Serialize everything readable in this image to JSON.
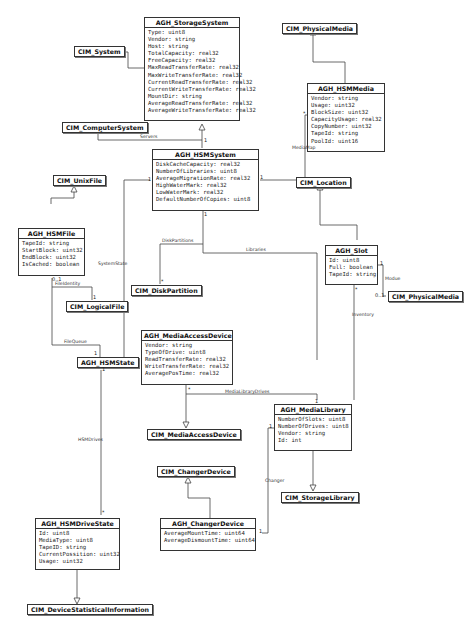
{
  "classes": {
    "storage_system": {
      "name": "AGH_StorageSystem",
      "attrs": [
        "Type: uint8",
        "Vendor: string",
        "Host: string",
        "TotalCapacity: real32",
        "FreeCapacity: real32",
        "MaxReadTransferRate: real32",
        "MaxWriteTransferRate: real32",
        "CurrentReadTransferRate: real32",
        "CurrentWriteTransferRate: real32",
        "MountDir: string",
        "AverageReadTransferRate: real32",
        "AverageWriteTransferRate: real32"
      ]
    },
    "hsm_media": {
      "name": "AGH_HSMMedia",
      "attrs": [
        "Vendor: string",
        "Usage: uint32",
        "BlockSize: uint32",
        "CapacityUsage: real32",
        "CopyNumber: uint32",
        "TapeId: string",
        "PoolId: uint16"
      ]
    },
    "hsm_system": {
      "name": "AGH_HSMSystem",
      "attrs": [
        "DiskCacheCapacity: real32",
        "NumberOfLibraries: uint8",
        "AverageMigrationRate: real32",
        "HighWaterMark: real32",
        "LowWaterMark: real32",
        "DefaultNumberOfCopies: uint8"
      ]
    },
    "hsm_file": {
      "name": "AGH_HSMFile",
      "attrs": [
        "TapeId: string",
        "StartBlock: uint32",
        "EndBlock: uint32",
        "IsCached: boolean"
      ]
    },
    "slot": {
      "name": "AGH_Slot",
      "attrs": [
        "Id: uint8",
        "Full: boolean",
        "TapeId: string"
      ]
    },
    "media_access_device": {
      "name": "AGH_MediaAccessDevice",
      "attrs": [
        "Vendor: string",
        "TypeOfDrive: uint8",
        "ReadTransferRate: real32",
        "WriteTransferRate: real32",
        "AveragePosTime: real32"
      ]
    },
    "media_library": {
      "name": "AGH_MediaLibrary",
      "attrs": [
        "NumberOfSlots: uint8",
        "NumberOfDrives: uint8",
        "Vendor: string",
        "Id: int"
      ]
    },
    "changer_device": {
      "name": "AGH_ChangerDevice",
      "attrs": [
        "AverageMountTime: uint64",
        "AverageDismountTime: uint64"
      ]
    },
    "hsm_drive_state": {
      "name": "AGH_HSMDriveState",
      "attrs": [
        "Id: uint8",
        "MediaType: uint8",
        "TapeID: string",
        "CurrentPossition: uint32",
        "Usage: uint32"
      ]
    }
  },
  "boxes": {
    "cim_system": "CIM_System",
    "cim_computer_system": "CIM_ComputerSystem",
    "cim_physical_media_top": "CIM_PhysicalMedia",
    "cim_unix_file": "CIM_UnixFile",
    "cim_location": "CIM_Location",
    "cim_disk_partition": "CIM_DiskPartition",
    "cim_logical_file": "CIM_LogicalFile",
    "cim_physical_media_slot": "CIM_PhysicalMedia",
    "agh_hsm_state": "AGH_HSMState",
    "cim_media_access_device": "CIM_MediaAccessDevice",
    "cim_changer_device": "CIM_ChangerDevice",
    "cim_storage_library": "CIM_StorageLibrary",
    "cim_device_statistical_information": "CIM_DeviceStatisticalInformation"
  },
  "associations": {
    "servers": "Servers",
    "media_map": "MediaMap",
    "disk_partitions": "DiskPartitions",
    "libraries": "Libraries",
    "system_state": "SystemState",
    "file_identity": "FileIdentity",
    "file_queue": "FileQueue",
    "modue": "Modue",
    "inventory": "Inventory",
    "media_library_drives": "MediaLibraryDrives",
    "changer": "Changer",
    "hsm_drives": "HSMDrives"
  },
  "multiplicities": {
    "one": "1",
    "many": "*",
    "zero_one": "0..1",
    "zero_n": "0..1"
  }
}
